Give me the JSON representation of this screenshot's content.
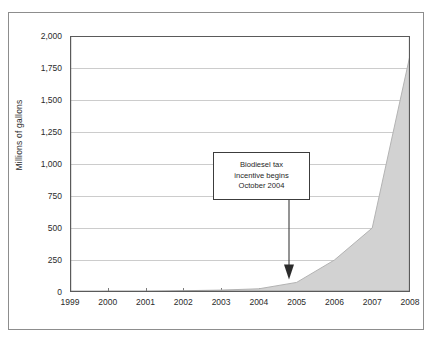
{
  "chart_data": {
    "type": "area",
    "title": "",
    "xlabel": "",
    "ylabel": "Millions of gallons",
    "xlim": [
      1999,
      2008
    ],
    "ylim": [
      0,
      2000
    ],
    "grid": true,
    "legend": null,
    "x": [
      1999,
      2000,
      2001,
      2002,
      2003,
      2004,
      2005,
      2006,
      2007,
      2008
    ],
    "values": [
      0,
      5,
      5,
      10,
      15,
      25,
      75,
      250,
      500,
      1850
    ],
    "series": [
      {
        "name": "Biodiesel production",
        "values": [
          0,
          5,
          5,
          10,
          15,
          25,
          75,
          250,
          500,
          1850
        ]
      }
    ],
    "x_tick_labels": [
      "1999",
      "2000",
      "2001",
      "2002",
      "2003",
      "2004",
      "2005",
      "2006",
      "2007",
      "2008"
    ],
    "y_tick_labels": [
      "0",
      "250",
      "500",
      "750",
      "1,000",
      "1,250",
      "1,500",
      "1,750",
      "2,000"
    ],
    "y_tick_values": [
      0,
      250,
      500,
      750,
      1000,
      1250,
      1500,
      1750,
      2000
    ],
    "annotations": [
      {
        "lines": [
          "Biodiesel tax",
          "incentive begins",
          "October 2004"
        ],
        "points_to_x": 2004.8,
        "points_to_y": 90
      }
    ],
    "colors": {
      "area_fill": "#d2d2d2",
      "area_edge": "#b3b3b3",
      "gridline": "#bfbfbf",
      "axis": "#5a5a5a",
      "frame": "#8d8d8d",
      "text": "#2b2b2b",
      "annotation_border": "#3c3c3c",
      "annotation_bg": "#ffffff",
      "background": "#ffffff"
    }
  }
}
